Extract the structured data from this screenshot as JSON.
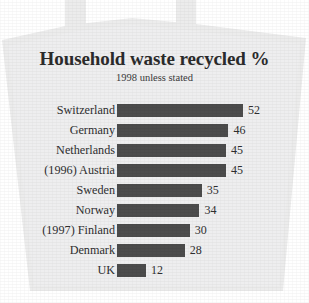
{
  "chart_data": {
    "type": "bar",
    "orientation": "horizontal",
    "title": "Household waste recycled %",
    "subtitle": "1998 unless stated",
    "xlabel": "",
    "ylabel": "",
    "xlim": [
      0,
      52
    ],
    "grid": false,
    "legend": false,
    "value_labels": true,
    "bar_color": "#4c4c4c",
    "background_color": "#ececed",
    "text_color": "#2f2f2f",
    "categories": [
      "Switzerland",
      "Germany",
      "Netherlands",
      "(1996) Austria",
      "Sweden",
      "Norway",
      "(1997) Finland",
      "Denmark",
      "UK"
    ],
    "values": [
      52,
      46,
      45,
      45,
      35,
      34,
      30,
      28,
      12
    ],
    "value_text": [
      "52",
      "46",
      "45",
      "45",
      "35",
      "34",
      "30",
      "28",
      "12"
    ],
    "notes": [
      "Austria figure is for 1996",
      "Finland figure is for 1997",
      "All other figures are for 1998"
    ]
  },
  "graphic": {
    "shape_name": "waste-bag-silhouette",
    "shape_fill": "#ececec",
    "handle_count": 2
  }
}
